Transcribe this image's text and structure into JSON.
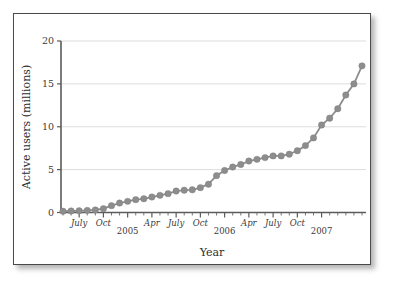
{
  "chart_data": {
    "type": "line",
    "title": "",
    "xlabel": "Year",
    "ylabel": "Active users (millions)",
    "ylim": [
      0,
      20
    ],
    "yticks": [
      0,
      5,
      10,
      15,
      20
    ],
    "ytick_labels": [
      "0",
      "5",
      "10",
      "15",
      "20"
    ],
    "grid": true,
    "legend": "none",
    "xtick_labels": [
      "July",
      "Oct",
      "2005",
      "Apr",
      "July",
      "Oct",
      "2006",
      "Apr",
      "July",
      "Oct",
      "2007"
    ],
    "xtick_indices": [
      2,
      5,
      8,
      11,
      14,
      17,
      20,
      23,
      26,
      29,
      32
    ],
    "x": [
      "2004-05",
      "2004-06",
      "2004-07",
      "2004-08",
      "2004-09",
      "2004-10",
      "2004-11",
      "2004-12",
      "2005-01",
      "2005-02",
      "2005-03",
      "2005-04",
      "2005-05",
      "2005-06",
      "2005-07",
      "2005-08",
      "2005-09",
      "2005-10",
      "2005-11",
      "2005-12",
      "2006-01",
      "2006-02",
      "2006-03",
      "2006-04",
      "2006-05",
      "2006-06",
      "2006-07",
      "2006-08",
      "2006-09",
      "2006-10",
      "2006-11",
      "2006-12",
      "2007-01",
      "2007-02",
      "2007-03",
      "2007-04"
    ],
    "series": [
      {
        "name": "Active users",
        "color": "#8d8d8d",
        "values": [
          0.15,
          0.18,
          0.2,
          0.25,
          0.3,
          0.45,
          0.8,
          1.1,
          1.3,
          1.5,
          1.6,
          1.8,
          2.0,
          2.2,
          2.5,
          2.6,
          2.65,
          2.9,
          3.3,
          4.3,
          4.9,
          5.3,
          5.6,
          6.0,
          6.2,
          6.4,
          6.6,
          6.6,
          6.8,
          7.2,
          7.8,
          8.7,
          10.2,
          11.0,
          12.1,
          13.7
        ]
      }
    ],
    "extra_values": [
      15.0,
      17.1
    ],
    "marker": "circle",
    "marker_size": 3.2
  },
  "figure": {
    "border_color": "#4a4a4a",
    "background": "#ffffff",
    "grid_color": "#d9d9d9",
    "axis_color": "#5b5b5b",
    "line_color": "#8e8e8e"
  }
}
